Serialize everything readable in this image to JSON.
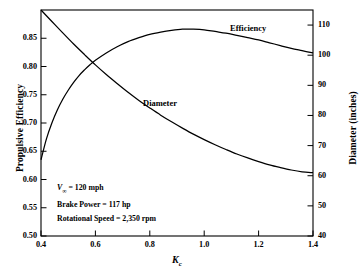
{
  "chart_data": {
    "type": "line",
    "title": "",
    "xlabel": "K_c",
    "xlabel_main": "K",
    "xlabel_sub": "c",
    "xlim": [
      0.4,
      1.4
    ],
    "xticks": [
      "0.4",
      "0.6",
      "0.8",
      "1.0",
      "1.2",
      "1.4"
    ],
    "xtick_values": [
      0.4,
      0.6,
      0.8,
      1.0,
      1.2,
      1.4
    ],
    "grid": false,
    "legend_position": "inline-labels",
    "left_axis": {
      "label": "Propulsive Efficiency",
      "ylim": [
        0.5,
        0.9
      ],
      "yticks": [
        "0.50",
        "0.55",
        "0.60",
        "0.65",
        "0.70",
        "0.75",
        "0.80",
        "0.85"
      ],
      "ytick_values": [
        0.5,
        0.55,
        0.6,
        0.65,
        0.7,
        0.75,
        0.8,
        0.85
      ]
    },
    "right_axis": {
      "label": "Diameter (inches)",
      "ylim": [
        40,
        115
      ],
      "yticks": [
        "40",
        "50",
        "60",
        "70",
        "80",
        "90",
        "100",
        "110"
      ],
      "ytick_values": [
        40,
        50,
        60,
        70,
        80,
        90,
        100,
        110
      ]
    },
    "series": [
      {
        "name": "Efficiency",
        "axis": "left",
        "label_text": "Efficiency",
        "x": [
          0.4,
          0.42,
          0.44,
          0.46,
          0.48,
          0.5,
          0.52,
          0.54,
          0.56,
          0.58,
          0.6,
          0.64,
          0.68,
          0.72,
          0.76,
          0.8,
          0.84,
          0.88,
          0.92,
          0.96,
          1.0,
          1.04,
          1.08,
          1.12,
          1.16,
          1.2,
          1.24,
          1.28,
          1.32,
          1.36,
          1.4
        ],
        "values": [
          0.635,
          0.672,
          0.7,
          0.723,
          0.742,
          0.758,
          0.772,
          0.784,
          0.794,
          0.803,
          0.811,
          0.824,
          0.835,
          0.844,
          0.851,
          0.857,
          0.861,
          0.864,
          0.866,
          0.866,
          0.865,
          0.862,
          0.859,
          0.855,
          0.851,
          0.847,
          0.842,
          0.837,
          0.832,
          0.828,
          0.824
        ]
      },
      {
        "name": "Diameter",
        "axis": "right",
        "label_text": "Diameter",
        "x": [
          0.4,
          0.44,
          0.48,
          0.52,
          0.56,
          0.6,
          0.64,
          0.68,
          0.72,
          0.76,
          0.8,
          0.84,
          0.88,
          0.92,
          0.96,
          1.0,
          1.04,
          1.08,
          1.12,
          1.16,
          1.2,
          1.24,
          1.28,
          1.32,
          1.36,
          1.4
        ],
        "values": [
          115.0,
          111.2,
          107.4,
          103.7,
          100.2,
          96.8,
          93.6,
          90.6,
          87.7,
          85.0,
          82.5,
          80.1,
          77.9,
          75.8,
          73.8,
          72.0,
          70.3,
          68.7,
          67.2,
          65.9,
          64.7,
          63.6,
          62.7,
          61.9,
          61.3,
          61.0
        ]
      }
    ],
    "annotations": [
      {
        "prefix": "V",
        "sub": "∞",
        "rest": " = 120 mph",
        "text": "V∞ = 120 mph"
      },
      {
        "prefix": "",
        "sub": "",
        "rest": "Brake Power = 117 hp",
        "text": "Brake Power = 117 hp"
      },
      {
        "prefix": "",
        "sub": "",
        "rest": "Rotational Speed = 2,350 rpm",
        "text": "Rotational Speed = 2,350 rpm"
      }
    ],
    "colors": {
      "curve": "#000000",
      "axis": "#000000",
      "background": "#ffffff"
    }
  }
}
